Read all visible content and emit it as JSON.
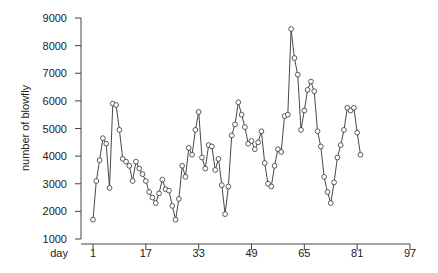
{
  "chart_data": {
    "type": "line",
    "title": "",
    "xlabel": "day",
    "ylabel": "number of blowfly",
    "xlim": [
      1,
      97
    ],
    "ylim": [
      1000,
      9000
    ],
    "x_ticks": [
      1,
      17,
      33,
      49,
      65,
      81,
      97
    ],
    "y_ticks": [
      1000,
      2000,
      3000,
      4000,
      5000,
      6000,
      7000,
      8000,
      9000
    ],
    "grid": false,
    "legend": null,
    "marker": "open-circle",
    "series": [
      {
        "name": "blowfly",
        "x": [
          1,
          2,
          3,
          4,
          5,
          6,
          7,
          8,
          9,
          10,
          11,
          12,
          13,
          14,
          15,
          16,
          17,
          18,
          19,
          20,
          21,
          22,
          23,
          24,
          25,
          26,
          27,
          28,
          29,
          30,
          31,
          32,
          33,
          34,
          35,
          36,
          37,
          38,
          39,
          40,
          41,
          42,
          43,
          44,
          45,
          46,
          47,
          48,
          49,
          50,
          51,
          52,
          53,
          54,
          55,
          56,
          57,
          58,
          59,
          60,
          61,
          62,
          63,
          64,
          65,
          66,
          67,
          68,
          69,
          70,
          71,
          72,
          73,
          74,
          75,
          76,
          77,
          78,
          79,
          80,
          81,
          82
        ],
        "values": [
          1700,
          3100,
          3850,
          4650,
          4450,
          2850,
          5900,
          5850,
          4950,
          3900,
          3800,
          3650,
          3100,
          3800,
          3550,
          3350,
          3100,
          2700,
          2500,
          2300,
          2650,
          3150,
          2800,
          2750,
          2200,
          1700,
          2450,
          3650,
          3250,
          4300,
          4050,
          4950,
          5600,
          3950,
          3550,
          4400,
          4350,
          3500,
          3900,
          2950,
          1900,
          2900,
          4750,
          5150,
          5950,
          5500,
          5050,
          4450,
          4550,
          4250,
          4500,
          4900,
          3750,
          3000,
          2900,
          3650,
          4250,
          4150,
          5450,
          5500,
          8600,
          7550,
          6950,
          4950,
          5650,
          6400,
          6700,
          6350,
          4900,
          4350,
          3250,
          2700,
          2300,
          3050,
          3950,
          4400,
          4950,
          5750,
          5650,
          5750,
          4850,
          4050
        ]
      }
    ]
  }
}
